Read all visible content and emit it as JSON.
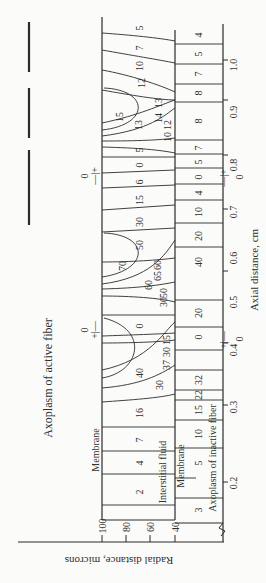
{
  "figure": {
    "rotation_deg": -90,
    "legend_lines_label": "Axoplasm of active fiber",
    "regions": {
      "active_axoplasm": "Axoplasm of active fiber",
      "active_membrane": "Membrane",
      "interstitial": "Interstitial fluid",
      "inactive_membrane": "Membrane",
      "inactive_axoplasm": "Axoplasm of inactive fiber"
    },
    "x_axis": {
      "label": "Axial distance, cm",
      "ticks": [
        "0.2",
        "0.3",
        "0.4",
        "0.5",
        "0.6",
        "0.7",
        "0.8",
        "0.9",
        "1.0"
      ]
    },
    "y_axis": {
      "label": "Radial distance, microns",
      "ticks": [
        "100",
        "80",
        "60",
        "40"
      ]
    },
    "sign_markers": [
      {
        "zero": "0",
        "signs": "+|—",
        "at": "0.45"
      },
      {
        "zero": "0",
        "signs": "—|+",
        "at": "0.77"
      }
    ],
    "interstitial_values": [
      "2",
      "4",
      "7",
      "16",
      "30",
      "37",
      "40",
      "30",
      "15",
      "0",
      "30",
      "50",
      "60",
      "70",
      "65",
      "60",
      "50",
      "30",
      "15",
      "6",
      "0",
      "5",
      "10",
      "12",
      "13",
      "14",
      "15",
      "13",
      "12",
      "10",
      "7",
      "5"
    ],
    "interstitial_labels": [
      {
        "v": "2"
      },
      {
        "v": "4"
      },
      {
        "v": "7"
      },
      {
        "v": "16"
      },
      {
        "v": "30"
      },
      {
        "v": "40"
      },
      {
        "v": "37"
      },
      {
        "v": "30"
      },
      {
        "v": "15"
      },
      {
        "v": "0"
      },
      {
        "v": "30"
      },
      {
        "v": "50"
      },
      {
        "v": "60"
      },
      {
        "v": "65"
      },
      {
        "v": "70"
      },
      {
        "v": "60"
      },
      {
        "v": "50"
      },
      {
        "v": "30"
      },
      {
        "v": "15"
      },
      {
        "v": "6"
      },
      {
        "v": "0"
      },
      {
        "v": "5"
      },
      {
        "v": "10"
      },
      {
        "v": "12"
      },
      {
        "v": "13"
      },
      {
        "v": "14"
      },
      {
        "v": "15"
      },
      {
        "v": "13"
      },
      {
        "v": "12"
      },
      {
        "v": "10"
      },
      {
        "v": "7"
      },
      {
        "v": "5"
      }
    ],
    "inactive_values": [
      "3",
      "5",
      "10",
      "15",
      "22",
      "32",
      "0",
      "20",
      "40",
      "40",
      "20",
      "10",
      "4",
      "0",
      "5",
      "7",
      "8",
      "8",
      "7",
      "5",
      "4"
    ]
  }
}
